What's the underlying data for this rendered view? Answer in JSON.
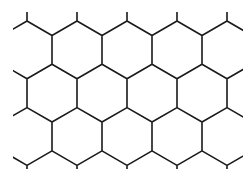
{
  "figure": {
    "type": "hexagonal-grid",
    "orientation": "pointy-top",
    "background": "#ffffff",
    "stroke": "#1a1a1a",
    "stroke_width": 1.6,
    "hex_width": 50,
    "hex_radius": 28.87,
    "origin_x": 52,
    "origin_y": 34,
    "rows": [
      -1,
      0,
      1,
      2,
      3,
      4
    ],
    "cols": [
      -2,
      -1,
      0,
      1,
      2,
      3,
      4
    ]
  }
}
